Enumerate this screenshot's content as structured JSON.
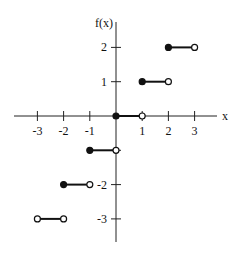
{
  "chart_data": {
    "type": "line",
    "title": "",
    "xlabel": "x",
    "ylabel": "f(x)",
    "xlim": [
      -3.9,
      4.0
    ],
    "ylim": [
      -3.8,
      2.8
    ],
    "grid": false,
    "legend": "none",
    "x_ticks": [
      {
        "value": -3,
        "label": "-3"
      },
      {
        "value": -2,
        "label": "-2"
      },
      {
        "value": -1,
        "label": "-1"
      },
      {
        "value": 1,
        "label": "1"
      },
      {
        "value": 2,
        "label": "2"
      },
      {
        "value": 3,
        "label": "3"
      }
    ],
    "y_ticks": [
      {
        "value": 2,
        "label": "2"
      },
      {
        "value": 1,
        "label": "1"
      },
      {
        "value": -1,
        "label": ""
      },
      {
        "value": -2,
        "label": "-2"
      },
      {
        "value": -3,
        "label": "-3"
      }
    ],
    "segments": [
      {
        "x_start": -3,
        "x_end": -2,
        "y": -3,
        "start_closed": false,
        "end_closed": false
      },
      {
        "x_start": -2,
        "x_end": -1,
        "y": -2,
        "start_closed": true,
        "end_closed": false
      },
      {
        "x_start": -1,
        "x_end": 0,
        "y": -1,
        "start_closed": true,
        "end_closed": false
      },
      {
        "x_start": 0,
        "x_end": 1,
        "y": 0,
        "start_closed": true,
        "end_closed": false
      },
      {
        "x_start": 1,
        "x_end": 2,
        "y": 1,
        "start_closed": true,
        "end_closed": false
      },
      {
        "x_start": 2,
        "x_end": 3,
        "y": 2,
        "start_closed": true,
        "end_closed": false
      }
    ]
  }
}
